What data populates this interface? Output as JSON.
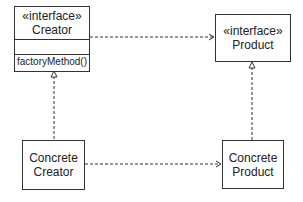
{
  "diagram": {
    "classes": {
      "creator": {
        "stereotype": "«interface»",
        "name": "Creator",
        "attributes": "",
        "operations": "factoryMethod()"
      },
      "product": {
        "stereotype": "«interface»",
        "name": "Product"
      },
      "concrete_creator": {
        "line1": "Concrete",
        "line2": "Creator"
      },
      "concrete_product": {
        "line1": "Concrete",
        "line2": "Product"
      }
    },
    "relations": [
      {
        "from": "Creator",
        "to": "Product",
        "type": "dependency"
      },
      {
        "from": "Concrete Creator",
        "to": "Concrete Product",
        "type": "dependency"
      },
      {
        "from": "Concrete Creator",
        "to": "Creator",
        "type": "realization"
      },
      {
        "from": "Concrete Product",
        "to": "Product",
        "type": "realization"
      }
    ]
  }
}
